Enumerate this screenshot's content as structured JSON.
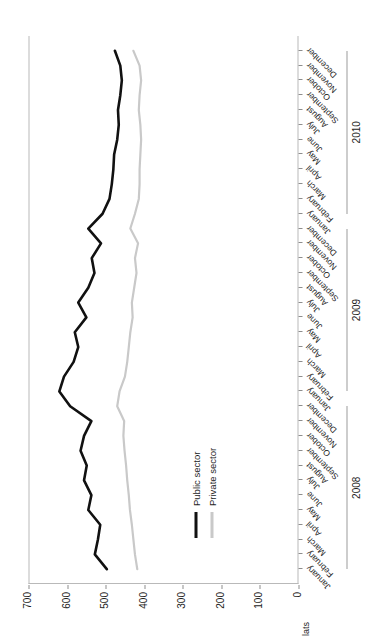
{
  "axis": {
    "unit_label": "lats",
    "y_ticks": [
      0,
      100,
      200,
      300,
      400,
      500,
      600,
      700
    ],
    "y_min": 0,
    "y_max": 700
  },
  "legend": {
    "items": [
      {
        "label": "Public sector",
        "color": "#111111"
      },
      {
        "label": "Private sector",
        "color": "#c9c9c9"
      }
    ]
  },
  "year_groups": [
    {
      "label": "2008",
      "start_index": 0,
      "end_index": 11
    },
    {
      "label": "2009",
      "start_index": 12,
      "end_index": 23
    },
    {
      "label": "2010",
      "start_index": 24,
      "end_index": 35
    }
  ],
  "chart_data": {
    "type": "line",
    "title": "",
    "xlabel": "",
    "ylabel": "lats",
    "ylim": [
      0,
      700
    ],
    "grid": false,
    "legend_position": "inside-left",
    "categories": [
      "January",
      "February",
      "March",
      "April",
      "May",
      "June",
      "July",
      "August",
      "September",
      "October",
      "November",
      "December",
      "January",
      "February",
      "March",
      "April",
      "May",
      "June",
      "July",
      "August",
      "September",
      "October",
      "November",
      "December",
      "January",
      "February",
      "March",
      "April",
      "May",
      "June",
      "July",
      "August",
      "September",
      "October",
      "November",
      "December"
    ],
    "series": [
      {
        "name": "Public sector",
        "color": "#111111",
        "values": [
          497,
          528,
          520,
          514,
          545,
          537,
          556,
          549,
          565,
          556,
          537,
          592,
          620,
          608,
          583,
          571,
          580,
          550,
          571,
          545,
          529,
          536,
          512,
          545,
          508,
          490,
          484,
          480,
          478,
          470,
          466,
          468,
          462,
          458,
          462,
          476
        ]
      },
      {
        "name": "Private sector",
        "color": "#c9c9c9",
        "values": [
          418,
          424,
          428,
          432,
          437,
          440,
          444,
          447,
          451,
          454,
          452,
          470,
          464,
          450,
          444,
          440,
          436,
          430,
          432,
          426,
          420,
          424,
          416,
          436,
          424,
          414,
          412,
          412,
          410,
          408,
          410,
          414,
          412,
          408,
          412,
          428
        ]
      }
    ]
  }
}
